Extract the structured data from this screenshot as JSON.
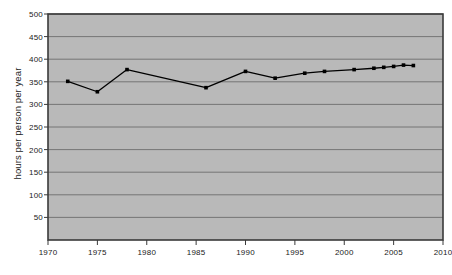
{
  "chart_data": {
    "type": "line",
    "title": "",
    "xlabel": "",
    "ylabel": "hours per person per year",
    "xlim": [
      1970,
      2010
    ],
    "ylim": [
      0,
      500
    ],
    "grid": true,
    "legend": "none",
    "xticks": [
      1970,
      1975,
      1980,
      1985,
      1990,
      1995,
      2000,
      2005,
      2010
    ],
    "yticks": [
      50,
      100,
      150,
      200,
      250,
      300,
      350,
      400,
      450,
      500
    ],
    "marker": "square",
    "line_color": "#000000",
    "plot_background": "#b9b9b9",
    "axis_color": "#3a3a3a",
    "gridline_color": "#6e6e6e",
    "series": [
      {
        "name": "hours per person per year",
        "x": [
          1972,
          1975,
          1978,
          1986,
          1990,
          1993,
          1996,
          1998,
          2001,
          2003,
          2004,
          2005,
          2006,
          2007
        ],
        "values": [
          351,
          328,
          377,
          337,
          373,
          358,
          369,
          373,
          377,
          380,
          382,
          384,
          387,
          386
        ]
      }
    ]
  },
  "axes": {
    "y_label_text": "hours per person per year",
    "y_tick_labels": [
      "500",
      "450",
      "400",
      "350",
      "300",
      "250",
      "200",
      "150",
      "100",
      "50"
    ],
    "x_tick_labels": [
      "1970",
      "1975",
      "1980",
      "1985",
      "1990",
      "1995",
      "2000",
      "2005",
      "2010"
    ]
  }
}
